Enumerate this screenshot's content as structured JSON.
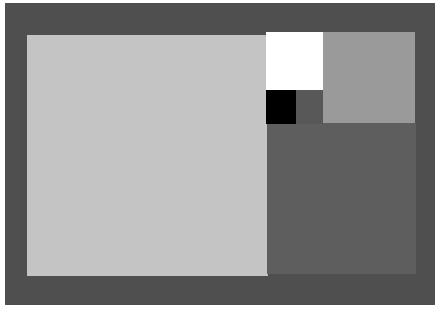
{
  "composition": {
    "description": "Abstract grayscale composition of rectangles in a Fibonacci-like arrangement on a dark gray frame",
    "colors": {
      "frame": "#4f4f4f",
      "large_light_rect": "#c4c4c4",
      "white_square": "#ffffff",
      "mid_gray_rect": "#9a9a9a",
      "black_square": "#000000",
      "small_dark_square": "#585858",
      "lower_right_rect": "#5e5e5e"
    }
  }
}
